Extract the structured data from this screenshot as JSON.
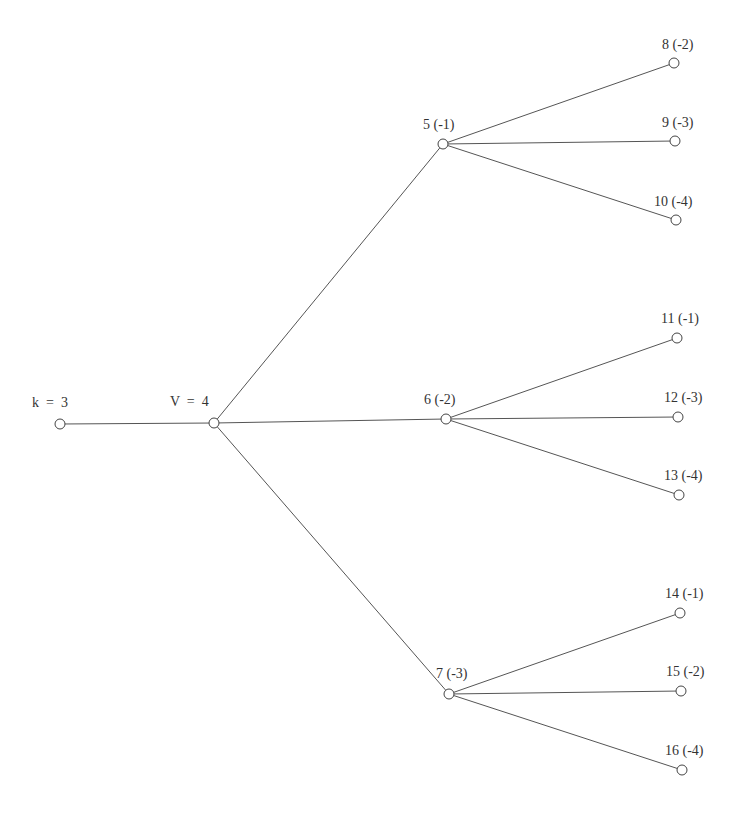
{
  "diagram": {
    "type": "tree",
    "root": {
      "id": "k",
      "label": "k  =  3"
    },
    "center": {
      "id": "v",
      "label": "V  =  4"
    },
    "nodes": [
      {
        "id": "k",
        "label": "k  =  3",
        "x": 60,
        "y": 424,
        "lx": 32,
        "ly": 407
      },
      {
        "id": "v",
        "label": "V  =  4",
        "x": 214,
        "y": 423,
        "lx": 170,
        "ly": 406
      },
      {
        "id": "n5",
        "label": "5 (-1)",
        "x": 443,
        "y": 144,
        "lx": 423,
        "ly": 129
      },
      {
        "id": "n6",
        "label": "6 (-2)",
        "x": 446,
        "y": 419,
        "lx": 424,
        "ly": 404
      },
      {
        "id": "n7",
        "label": "7 (-3)",
        "x": 449,
        "y": 694,
        "lx": 436,
        "ly": 678
      },
      {
        "id": "n8",
        "label": "8 (-2)",
        "x": 674,
        "y": 63,
        "lx": 662,
        "ly": 49
      },
      {
        "id": "n9",
        "label": "9 (-3)",
        "x": 675,
        "y": 141,
        "lx": 662,
        "ly": 127
      },
      {
        "id": "n10",
        "label": "10 (-4)",
        "x": 676,
        "y": 220,
        "lx": 654,
        "ly": 206
      },
      {
        "id": "n11",
        "label": "11 (-1)",
        "x": 677,
        "y": 338,
        "lx": 661,
        "ly": 323
      },
      {
        "id": "n12",
        "label": "12 (-3)",
        "x": 678,
        "y": 417,
        "lx": 664,
        "ly": 402
      },
      {
        "id": "n13",
        "label": "13 (-4)",
        "x": 679,
        "y": 495,
        "lx": 664,
        "ly": 480
      },
      {
        "id": "n14",
        "label": "14 (-1)",
        "x": 680,
        "y": 613,
        "lx": 665,
        "ly": 598
      },
      {
        "id": "n15",
        "label": "15 (-2)",
        "x": 681,
        "y": 691,
        "lx": 666,
        "ly": 676
      },
      {
        "id": "n16",
        "label": "16 (-4)",
        "x": 682,
        "y": 770,
        "lx": 665,
        "ly": 755
      }
    ],
    "edges": [
      [
        "k",
        "v"
      ],
      [
        "v",
        "n5"
      ],
      [
        "v",
        "n6"
      ],
      [
        "v",
        "n7"
      ],
      [
        "n5",
        "n8"
      ],
      [
        "n5",
        "n9"
      ],
      [
        "n5",
        "n10"
      ],
      [
        "n6",
        "n11"
      ],
      [
        "n6",
        "n12"
      ],
      [
        "n6",
        "n13"
      ],
      [
        "n7",
        "n14"
      ],
      [
        "n7",
        "n15"
      ],
      [
        "n7",
        "n16"
      ]
    ],
    "colors": {
      "edge": "#555555",
      "node_stroke": "#444444",
      "node_fill": "#ffffff",
      "text": "#333333"
    }
  }
}
